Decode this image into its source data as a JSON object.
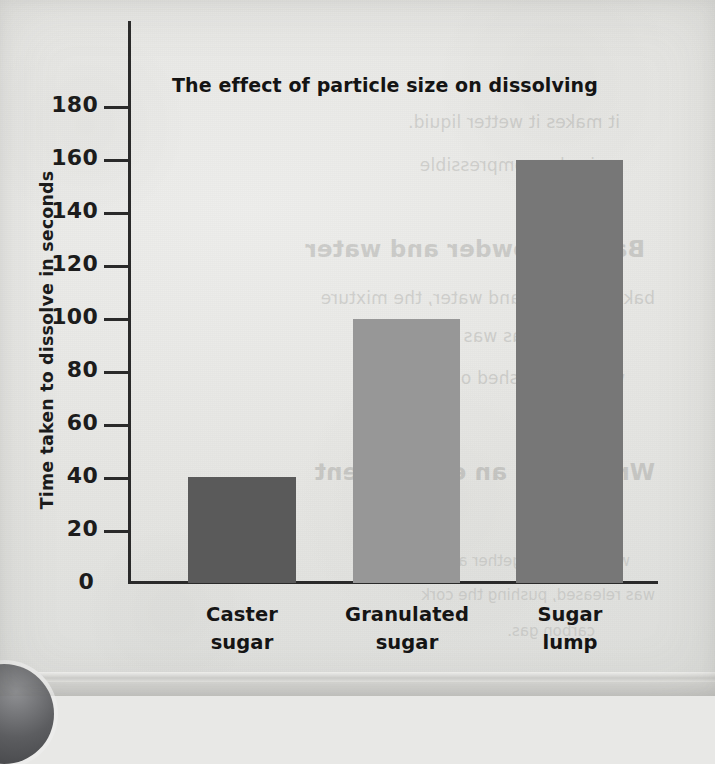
{
  "chart_data": {
    "type": "bar",
    "title": "The effect of particle size on dissolving",
    "xlabel": "",
    "ylabel": "Time taken to dissolve in seconds",
    "categories": [
      "Caster sugar",
      "Granulated sugar",
      "Sugar lump"
    ],
    "category_lines": [
      [
        "Caster",
        "sugar"
      ],
      [
        "Granulated",
        "sugar"
      ],
      [
        "Sugar",
        "lump"
      ]
    ],
    "values": [
      40,
      100,
      160
    ],
    "ylim": [
      0,
      190
    ],
    "ytick_labels": [
      "180",
      "160",
      "140",
      "120",
      "100",
      "80",
      "60",
      "40",
      "20",
      "0"
    ],
    "ytick_values": [
      180,
      160,
      140,
      120,
      100,
      80,
      60,
      40,
      20,
      0
    ],
    "ytick_step": 20,
    "grid": false,
    "legend": "none",
    "bar_colors": [
      "#5a5a5a",
      "#979797",
      "#777777"
    ],
    "axis_color": "#2a2a2a"
  },
  "bars": [
    {
      "label": "Caster sugar",
      "value": 40,
      "color": "#5a5a5a",
      "x": 188,
      "width": 108,
      "label_x": 167
    },
    {
      "label": "Granulated sugar",
      "value": 100,
      "color": "#979797",
      "x": 353,
      "width": 107,
      "label_x": 332
    },
    {
      "label": "Sugar lump",
      "value": 160,
      "color": "#777777",
      "x": 516,
      "width": 107,
      "label_x": 495
    }
  ],
  "yticks": [
    {
      "label": "180",
      "y": 107
    },
    {
      "label": "160",
      "y": 160
    },
    {
      "label": "140",
      "y": 213
    },
    {
      "label": "120",
      "y": 266
    },
    {
      "label": "100",
      "y": 319
    },
    {
      "label": "80",
      "y": 372
    },
    {
      "label": "60",
      "y": 425
    },
    {
      "label": "40",
      "y": 478
    },
    {
      "label": "20",
      "y": 531
    },
    {
      "label": "0",
      "y": 584
    }
  ],
  "ghost_text": [
    {
      "t": "it makes it wetter liquid.",
      "x": 95,
      "y": 112,
      "c": "body"
    },
    {
      "t": "is also compressible",
      "x": 120,
      "y": 155,
      "c": "body"
    },
    {
      "t": "Baking powder and water",
      "x": 70,
      "y": 236,
      "c": "head"
    },
    {
      "t": "baking powder and water, the mixture",
      "x": 60,
      "y": 288,
      "c": "body"
    },
    {
      "t": "as a gas was made.",
      "x": 140,
      "y": 326,
      "c": "body"
    },
    {
      "t": "was then pushed out. The",
      "x": 90,
      "y": 368,
      "c": "body"
    },
    {
      "t": "Writing up an experiment",
      "x": 60,
      "y": 459,
      "c": "head"
    },
    {
      "t": "of",
      "x": 140,
      "y": 500,
      "c": "head"
    },
    {
      "t": "were added together and a",
      "x": 85,
      "y": 552,
      "c": "small"
    },
    {
      "t": "was released, pushing the cork",
      "x": 60,
      "y": 586,
      "c": "small"
    },
    {
      "t": "carbon gas.",
      "x": 120,
      "y": 622,
      "c": "small"
    }
  ]
}
